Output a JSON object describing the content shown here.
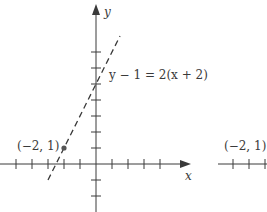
{
  "figure": {
    "y_axis_label": "y",
    "x_axis_label": "x",
    "equation_label": "y − 1 = 2(x + 2)",
    "point_label": "(−2, 1)",
    "point": {
      "x": -2,
      "y": 1
    },
    "line": {
      "slope": 2,
      "point": [
        -2,
        1
      ],
      "style": "dashed"
    },
    "x_ticks": [
      -5,
      -4,
      -3,
      -2,
      -1,
      1,
      2,
      3,
      4
    ],
    "y_ticks": [
      -2,
      -1,
      1,
      2,
      3,
      4,
      5,
      6,
      7
    ],
    "colors": {
      "axis": "#3a3a3a",
      "line": "#3a3a3a",
      "point": "#555555"
    }
  },
  "partial_figure": {
    "point_label": "(−2, 1)"
  }
}
